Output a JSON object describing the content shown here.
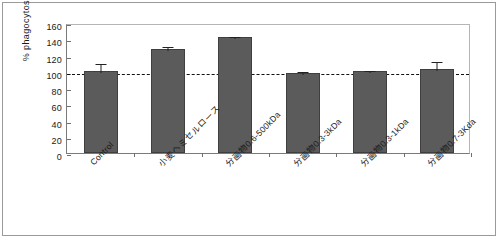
{
  "chart_data": {
    "type": "bar",
    "title": "",
    "xlabel": "",
    "ylabel": "% phagocytosis",
    "ylim": [
      0,
      160
    ],
    "yticks": [
      0,
      20,
      40,
      60,
      80,
      100,
      120,
      140,
      160
    ],
    "grid": false,
    "legend": null,
    "reference_line": {
      "value": 100,
      "style": "dashed",
      "color": "#111111"
    },
    "categories": [
      "Control",
      "小麦ヘミセルロース",
      "分画物0.6-500kDa",
      "分画物0.3-3kDa",
      "分画物0.3-1kDa",
      "分画物0.7-3Kda"
    ],
    "values": [
      101,
      128,
      143,
      99,
      101,
      103
    ],
    "errors": [
      11,
      5,
      2,
      3,
      3,
      12
    ],
    "bar_color": "#5b5b5b"
  },
  "axis": {
    "y_label": "% phagocytosis",
    "y_tick_labels": [
      "160",
      "140",
      "120",
      "100",
      "80",
      "60",
      "40",
      "20",
      "0"
    ]
  }
}
